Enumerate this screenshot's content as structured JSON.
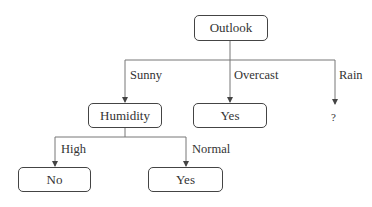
{
  "diagram": {
    "type": "decision-tree",
    "nodes": {
      "root": {
        "label": "Outlook"
      },
      "humidity": {
        "label": "Humidity"
      },
      "overcast_leaf": {
        "label": "Yes"
      },
      "rain_leaf": {
        "label": "?"
      },
      "high_leaf": {
        "label": "No"
      },
      "normal_leaf": {
        "label": "Yes"
      }
    },
    "edges": {
      "sunny": {
        "label": "Sunny",
        "from": "Outlook",
        "to": "Humidity"
      },
      "overcast": {
        "label": "Overcast",
        "from": "Outlook",
        "to": "Yes"
      },
      "rain": {
        "label": "Rain",
        "from": "Outlook",
        "to": "?"
      },
      "high": {
        "label": "High",
        "from": "Humidity",
        "to": "No"
      },
      "normal": {
        "label": "Normal",
        "from": "Humidity",
        "to": "Yes"
      }
    },
    "colors": {
      "line": "#555555",
      "text": "#333333",
      "background": "#ffffff"
    }
  }
}
